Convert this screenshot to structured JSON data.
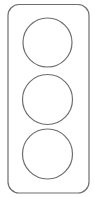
{
  "diagram": {
    "type": "traffic-light-outline",
    "stroke_color": "#6e6e6e",
    "background_color": "#ffffff",
    "housing": {
      "x": 8,
      "y": 4.5,
      "width": 81,
      "height": 188.5,
      "rx": 11
    },
    "lights": [
      {
        "name": "top-light",
        "cx": 47.5,
        "cy": 42.5,
        "r": 24.5
      },
      {
        "name": "middle-light",
        "cx": 47.5,
        "cy": 99.5,
        "r": 25
      },
      {
        "name": "bottom-light",
        "cx": 47.5,
        "cy": 154,
        "r": 25
      }
    ]
  }
}
